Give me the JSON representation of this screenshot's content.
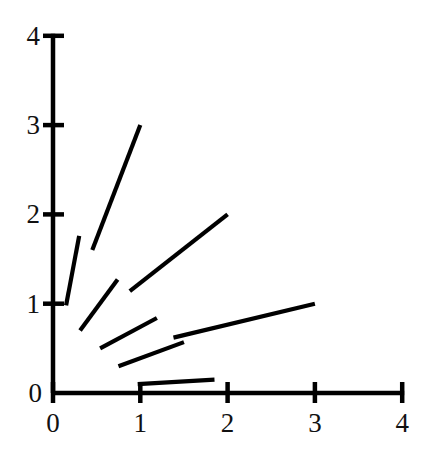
{
  "chart_data": {
    "type": "line",
    "title": "",
    "subtitle": "",
    "xlabel": "",
    "ylabel": "",
    "xlim": [
      0,
      4
    ],
    "ylim": [
      0,
      4
    ],
    "xticks": [
      0,
      1,
      2,
      3,
      4
    ],
    "yticks": [
      0,
      1,
      2,
      3,
      4
    ],
    "xtick_labels": [
      "0",
      "1",
      "2",
      "3",
      "4"
    ],
    "ytick_labels": [
      "0",
      "1",
      "2",
      "3",
      "4"
    ],
    "grid": false,
    "legend": "none",
    "annotations": [],
    "line_color": "#000000",
    "axis_color": "#000000",
    "background": "#ffffff",
    "series": [
      {
        "name": "segment-1",
        "comment": "short steep segment near y-axis",
        "x": [
          0.15,
          0.3
        ],
        "y": [
          0.98,
          1.76
        ]
      },
      {
        "name": "segment-2",
        "comment": "long steep segment rising to (1,3)",
        "x": [
          0.45,
          1.0
        ],
        "y": [
          1.6,
          3.0
        ]
      },
      {
        "name": "segment-3",
        "comment": "medium segment below segment-2",
        "x": [
          0.31,
          0.74
        ],
        "y": [
          0.7,
          1.27
        ]
      },
      {
        "name": "segment-4",
        "comment": "long diagonal rising to (2,2)",
        "x": [
          0.88,
          2.0
        ],
        "y": [
          1.14,
          2.0
        ]
      },
      {
        "name": "segment-5",
        "comment": "shallow segment from (0.54,0.50) to (1.19,0.84)",
        "x": [
          0.54,
          1.19
        ],
        "y": [
          0.5,
          0.84
        ]
      },
      {
        "name": "segment-6",
        "comment": "shallow segment from (0.75,0.30) to (1.50,0.57)",
        "x": [
          0.75,
          1.5
        ],
        "y": [
          0.3,
          0.57
        ]
      },
      {
        "name": "segment-7",
        "comment": "long shallow segment rising to (3,1)",
        "x": [
          1.38,
          3.0
        ],
        "y": [
          0.62,
          1.0
        ]
      },
      {
        "name": "segment-8",
        "comment": "nearly flat segment just above x-axis",
        "x": [
          0.97,
          1.85
        ],
        "y": [
          0.1,
          0.15
        ]
      }
    ]
  }
}
